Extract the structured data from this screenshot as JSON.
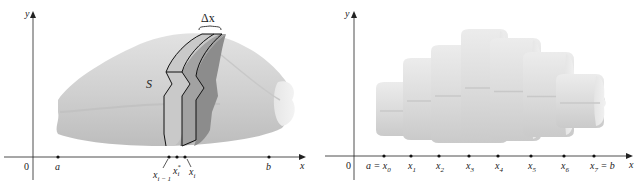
{
  "left_figure": {
    "axis_x_label": "x",
    "axis_y_label": "y",
    "origin_label": "0",
    "solid_label": "S",
    "delta_label": "Δx",
    "points": [
      {
        "name": "a",
        "label": "a"
      },
      {
        "name": "x_i_minus_1",
        "label": "x",
        "sub": "i − 1"
      },
      {
        "name": "x_i_star",
        "label": "x",
        "sub": "i",
        "sup": "*"
      },
      {
        "name": "x_i",
        "label": "x",
        "sub": "i"
      },
      {
        "name": "b",
        "label": "b"
      }
    ],
    "colors": {
      "solid": "#d4d4d4",
      "slab_light": "#bdbdbd",
      "slab_dark": "#8f8f8f",
      "outline": "#111111"
    }
  },
  "right_figure": {
    "axis_x_label": "x",
    "axis_y_label": "y",
    "origin_label": "0",
    "points": [
      {
        "label": "a = x",
        "sub": "0"
      },
      {
        "label": "x",
        "sub": "1"
      },
      {
        "label": "x",
        "sub": "2"
      },
      {
        "label": "x",
        "sub": "3"
      },
      {
        "label": "x",
        "sub": "4"
      },
      {
        "label": "x",
        "sub": "5"
      },
      {
        "label": "x",
        "sub": "6"
      },
      {
        "label": "x",
        "sub": "7",
        "suffix": " = b"
      }
    ],
    "slab_count": 7,
    "colors": {
      "slab": "#dcdcdc",
      "slab_shadow": "#c4c4c4"
    }
  }
}
